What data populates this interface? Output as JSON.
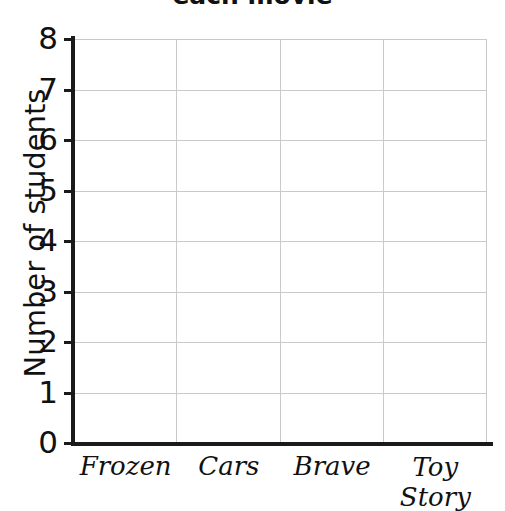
{
  "chart_data": {
    "type": "bar",
    "title": "each movie",
    "xlabel": "",
    "ylabel": "Number of students",
    "categories": [
      "Frozen",
      "Cars",
      "Brave",
      "Toy Story"
    ],
    "values": [
      null,
      null,
      null,
      null
    ],
    "series": [
      {
        "name": "Number of students",
        "values": [
          null,
          null,
          null,
          null
        ]
      }
    ],
    "ylim": [
      0,
      8
    ],
    "ytick_labels": [
      "8",
      "7",
      "6",
      "5",
      "4",
      "3",
      "2",
      "1",
      "0"
    ],
    "ytick_values": [
      8,
      7,
      6,
      5,
      4,
      3,
      2,
      1,
      0
    ],
    "grid": true,
    "grid_color": "#c9c9c9",
    "axis_color": "#1a1a1a",
    "background": "#ffffff",
    "legend": null,
    "legend_position": "none"
  },
  "axis": {
    "y_title": "Number of students",
    "ticks_y": [
      {
        "label": "8",
        "value": 8
      },
      {
        "label": "7",
        "value": 7
      },
      {
        "label": "6",
        "value": 6
      },
      {
        "label": "5",
        "value": 5
      },
      {
        "label": "4",
        "value": 4
      },
      {
        "label": "3",
        "value": 3
      },
      {
        "label": "2",
        "value": 2
      },
      {
        "label": "1",
        "value": 1
      },
      {
        "label": "0",
        "value": 0
      }
    ],
    "ticks_x": [
      {
        "label": "Frozen"
      },
      {
        "label": "Cars"
      },
      {
        "label": "Brave"
      },
      {
        "label": "Toy Story"
      }
    ]
  },
  "header": {
    "title": "each movie"
  }
}
